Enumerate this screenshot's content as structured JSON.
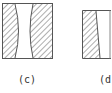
{
  "figure": {
    "panels": [
      {
        "id": "c",
        "label": "(c)",
        "description": "Rectangular element with two hatched regions whose inner boundaries curve inward, leaving an hourglass-shaped clear gap in the middle"
      },
      {
        "id": "d",
        "label": "(d)",
        "description": "Rectangular element with a single hatched region on the left bounded by a slanted straight edge; remainder clear"
      }
    ],
    "colors": {
      "stroke": "#555555",
      "hatch": "#777777",
      "background": "#ffffff",
      "text": "#333333"
    }
  }
}
